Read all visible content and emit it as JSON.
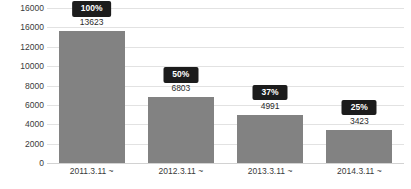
{
  "chart_data": {
    "type": "bar",
    "title": "",
    "xlabel": "",
    "ylabel": "",
    "categories": [
      "2011.3.11 ~",
      "2012.3.11 ~",
      "2013.3.11 ~",
      "2014.3.11 ~"
    ],
    "values": [
      13623,
      6803,
      4991,
      3423
    ],
    "value_labels": [
      "13623",
      "6803",
      "4991",
      "3423"
    ],
    "percent_labels": [
      "100%",
      "50%",
      "37%",
      "25%"
    ],
    "percent_values": [
      100,
      50,
      37,
      25
    ],
    "ylim": [
      0,
      16000
    ],
    "ytick_labels": [
      "16000",
      "16000",
      "12000",
      "10000",
      "8000",
      "6000",
      "4000",
      "2000",
      "0"
    ],
    "ytick_values": [
      16000,
      14000,
      12000,
      10000,
      8000,
      6000,
      4000,
      2000,
      0
    ],
    "grid": true,
    "legend": "none",
    "colors": {
      "bar": "#828282",
      "badge_background": "#1c1c1c",
      "badge_text": "#ffffff",
      "gridline": "#e2e2e2",
      "axis_text": "#3a3a3a",
      "background": "#ffffff"
    }
  }
}
